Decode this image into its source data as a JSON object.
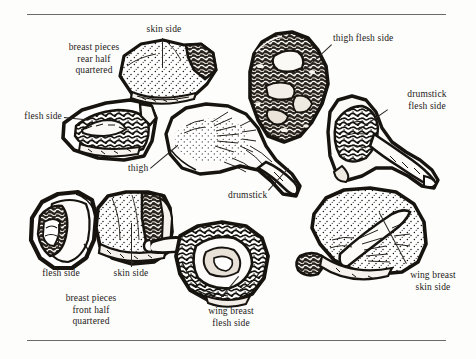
{
  "page": {
    "kind": "book-illustration-plate",
    "background_color": "#fdfdfc",
    "ink_color": "#17140f",
    "rule_color": "#6d6a66"
  },
  "rules": [
    {
      "name": "top-rule",
      "x": 27,
      "y": 14,
      "width": 419
    },
    {
      "name": "bottom-rule",
      "x": 27,
      "y": 340,
      "width": 419
    }
  ],
  "labels": {
    "skin_side_top": "skin side",
    "breast_pieces_rear": "breast pieces\nrear half\nquartered",
    "flesh_side_left": "flesh side",
    "thigh": "thigh",
    "thigh_flesh_side": "thigh flesh side",
    "drumstick_flesh_side": "drumstick\nflesh side",
    "drumstick": "drumstick",
    "flesh_side_bottom": "flesh side",
    "skin_side_bottom": "skin side",
    "breast_pieces_front": "breast pieces\nfront half\nquartered",
    "wing_breast_flesh_side": "wing breast\nflesh side",
    "wing_breast_skin_side": "wing breast\nskin side"
  },
  "specimens": [
    {
      "name": "breast-rear-half-skin-side",
      "caption_ref": "skin_side_top"
    },
    {
      "name": "breast-rear-half-flesh-side",
      "caption_ref": "flesh_side_left"
    },
    {
      "name": "thigh-piece",
      "caption_ref": "thigh"
    },
    {
      "name": "thigh-flesh-side-piece",
      "caption_ref": "thigh_flesh_side"
    },
    {
      "name": "drumstick-flesh-side-piece",
      "caption_ref": "drumstick_flesh_side"
    },
    {
      "name": "drumstick-piece",
      "caption_ref": "drumstick"
    },
    {
      "name": "breast-front-half-flesh-side",
      "caption_ref": "flesh_side_bottom"
    },
    {
      "name": "breast-front-half-skin-side",
      "caption_ref": "skin_side_bottom"
    },
    {
      "name": "wing-breast-flesh-side-piece",
      "caption_ref": "wing_breast_flesh_side"
    },
    {
      "name": "wing-breast-skin-side-piece",
      "caption_ref": "wing_breast_skin_side"
    }
  ]
}
